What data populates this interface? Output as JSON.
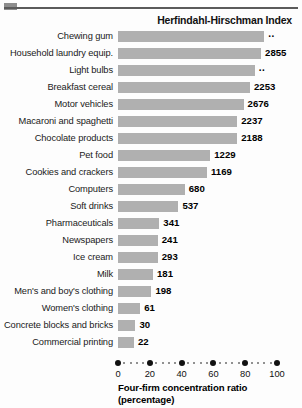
{
  "chart_data": {
    "type": "bar",
    "orientation": "horizontal",
    "title": "Herfindahl-Hirschman Index",
    "xlabel": "Four-firm concentration ratio",
    "xlabel_line2": "(percentage)",
    "ylabel": "",
    "xlim": [
      0,
      100
    ],
    "grid": false,
    "legend": null,
    "xticks": [
      0,
      20,
      40,
      60,
      80,
      100
    ],
    "xticklabels": [
      "0",
      "20",
      "40",
      "60",
      "80",
      "100"
    ],
    "na_marker": "..",
    "bar_color": "#b0b0b0",
    "categories": [
      "Chewing gum",
      "Household laundry equip.",
      "Light bulbs",
      "Breakfast cereal",
      "Motor vehicles",
      "Macaroni and spaghetti",
      "Chocolate products",
      "Pet food",
      "Cookies and crackers",
      "Computers",
      "Soft drinks",
      "Pharmaceuticals",
      "Newspapers",
      "Ice cream",
      "Milk",
      "Men's and boy's clothing",
      "Women's clothing",
      "Concrete blocks and bricks",
      "Commercial printing"
    ],
    "values": [
      92,
      90,
      86,
      83,
      79,
      75,
      75,
      58,
      56,
      42,
      38,
      26,
      25,
      25,
      22,
      21,
      14,
      11,
      10
    ],
    "hhi_labels": [
      "..",
      "2855",
      "..",
      "2253",
      "2676",
      "2237",
      "2188",
      "1229",
      "1169",
      "680",
      "537",
      "341",
      "241",
      "293",
      "181",
      "198",
      "61",
      "30",
      "22"
    ]
  }
}
